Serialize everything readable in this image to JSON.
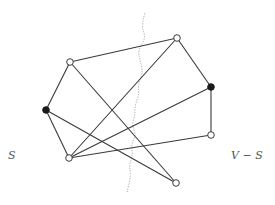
{
  "diagram": {
    "type": "graph-cut",
    "labels": {
      "left": "S",
      "right": "V − S"
    },
    "colors": {
      "edge": "#3a3a3a",
      "node_open_fill": "#ffffff",
      "node_filled": "#1a1a1a",
      "cut_line": "#9a9a9a",
      "label": "#555555"
    },
    "nodes": [
      {
        "id": "A",
        "x": 70,
        "y": 62,
        "filled": false
      },
      {
        "id": "B",
        "x": 177,
        "y": 38,
        "filled": false
      },
      {
        "id": "C",
        "x": 46,
        "y": 110,
        "filled": true
      },
      {
        "id": "D",
        "x": 211,
        "y": 87,
        "filled": true
      },
      {
        "id": "E",
        "x": 69,
        "y": 158,
        "filled": false
      },
      {
        "id": "G",
        "x": 211,
        "y": 135,
        "filled": false
      },
      {
        "id": "F",
        "x": 176,
        "y": 183,
        "filled": false
      }
    ],
    "edges": [
      [
        "A",
        "B"
      ],
      [
        "A",
        "F"
      ],
      [
        "A",
        "C"
      ],
      [
        "B",
        "E"
      ],
      [
        "B",
        "D"
      ],
      [
        "D",
        "E"
      ],
      [
        "D",
        "G"
      ],
      [
        "C",
        "E"
      ],
      [
        "C",
        "F"
      ],
      [
        "E",
        "G"
      ]
    ],
    "cut_path": [
      [
        145,
        13
      ],
      [
        141,
        25
      ],
      [
        146,
        38
      ],
      [
        138,
        50
      ],
      [
        140,
        60
      ],
      [
        143,
        72
      ],
      [
        138,
        85
      ],
      [
        139,
        95
      ],
      [
        135,
        105
      ],
      [
        135,
        115
      ],
      [
        132,
        125
      ],
      [
        136,
        135
      ],
      [
        131,
        145
      ],
      [
        133,
        155
      ],
      [
        129,
        165
      ],
      [
        131,
        175
      ],
      [
        127,
        192
      ]
    ]
  }
}
